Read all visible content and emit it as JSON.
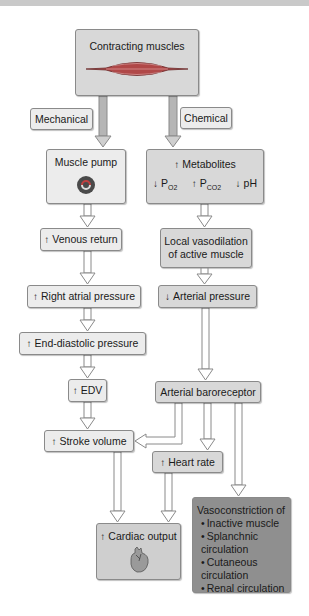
{
  "title_bar": {},
  "nodes": {
    "contracting_muscles": "Contracting muscles",
    "mechanical": "Mechanical",
    "chemical": "Chemical",
    "muscle_pump": "Muscle pump",
    "metabolites": "Metabolites",
    "po2": "P",
    "po2_sub": "O2",
    "pco2": "P",
    "pco2_sub": "CO2",
    "ph": "pH",
    "venous_return": "Venous return",
    "local_vasodilation_1": "Local vasodilation",
    "local_vasodilation_2": "of active muscle",
    "right_atrial_pressure": "Right atrial pressure",
    "arterial_pressure": "Arterial pressure",
    "end_diastolic_pressure": "End-diastolic pressure",
    "edv": "EDV",
    "arterial_baroreceptor": "Arterial baroreceptor",
    "stroke_volume": "Stroke volume",
    "heart_rate": "Heart rate",
    "cardiac_output": "Cardiac output",
    "vasoconstriction_title": "Vasoconstriction of",
    "vasoconstriction_items": [
      "Inactive muscle",
      "Splanchnic circulation",
      "Cutaneous circulation",
      "Renal circulation"
    ]
  },
  "colors": {
    "light_box": "#ececec",
    "mid_box": "#d8d8d8",
    "dark_box": "#8f8f8f",
    "border": "#8a8a8a"
  }
}
